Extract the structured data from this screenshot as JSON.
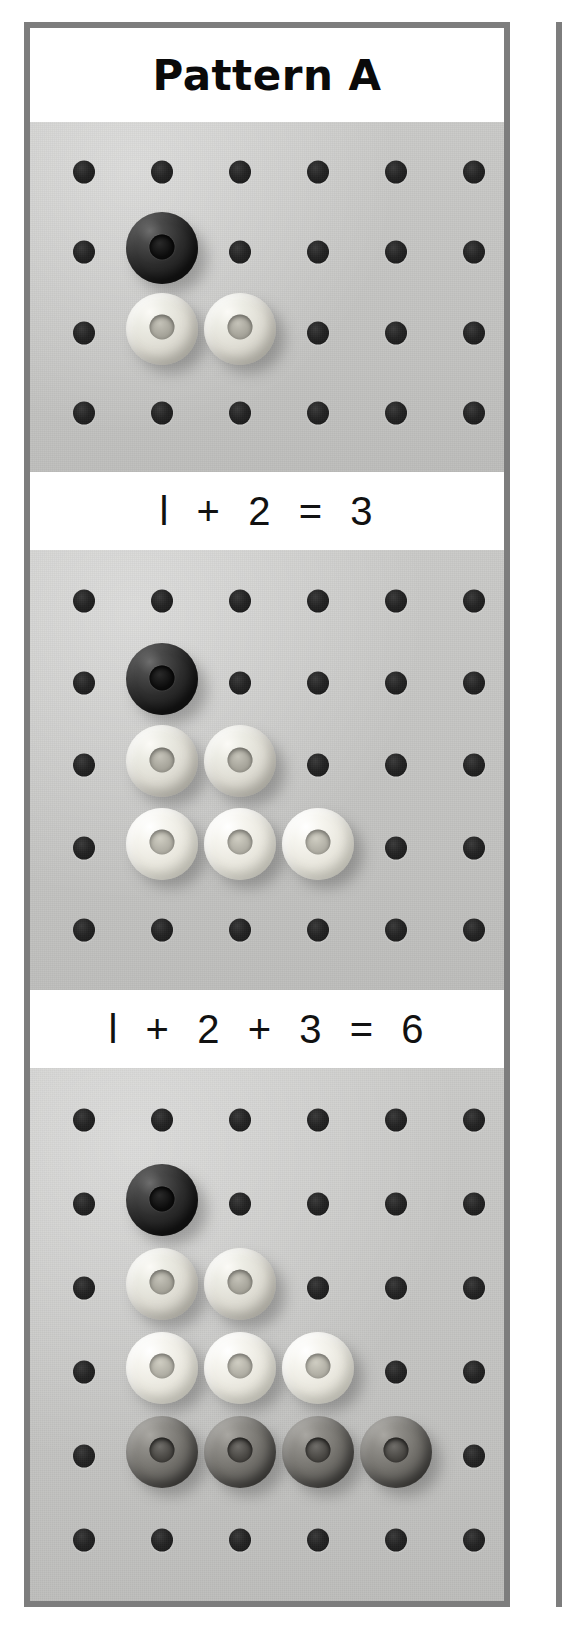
{
  "page": {
    "title": "Pattern A",
    "width": 570,
    "height": 1643,
    "background": "#ffffff"
  },
  "colors": {
    "frame_border": "#7d7d7d",
    "board": "#c6c6c4",
    "hole": "#1a1a1a",
    "bead_dark": "#2b2b2b",
    "bead_light": "#e2e0d7",
    "bead_pale": "#efede4",
    "bead_medium": "#74726d",
    "caption_background": "#ffffff",
    "caption_text": "#111111"
  },
  "header": {
    "label": "Pattern A"
  },
  "panels": [
    {
      "id": "panel-1",
      "name": "pegboard-step-1",
      "rows": 4,
      "cols": 6,
      "caption": "1 + 2 = 3",
      "caption_display": "l  +  2  =  3",
      "beads": [
        {
          "row": 1,
          "col": 1,
          "color": "dark",
          "count_in_row": 1
        },
        {
          "row": 2,
          "col": 1,
          "color": "light",
          "count_in_row": 2
        },
        {
          "row": 2,
          "col": 2,
          "color": "light",
          "count_in_row": 2
        }
      ],
      "bead_rows": [
        1,
        2
      ],
      "total_beads": 3
    },
    {
      "id": "panel-2",
      "name": "pegboard-step-2",
      "rows": 5,
      "cols": 6,
      "caption": "1 + 2 + 3 = 6",
      "caption_display": "l  +  2  +  3  =  6",
      "beads": [
        {
          "row": 1,
          "col": 1,
          "color": "dark",
          "count_in_row": 1
        },
        {
          "row": 2,
          "col": 1,
          "color": "light",
          "count_in_row": 2
        },
        {
          "row": 2,
          "col": 2,
          "color": "light",
          "count_in_row": 2
        },
        {
          "row": 3,
          "col": 1,
          "color": "pale",
          "count_in_row": 3
        },
        {
          "row": 3,
          "col": 2,
          "color": "pale",
          "count_in_row": 3
        },
        {
          "row": 3,
          "col": 3,
          "color": "pale",
          "count_in_row": 3
        }
      ],
      "bead_rows": [
        1,
        2,
        3
      ],
      "total_beads": 6
    },
    {
      "id": "panel-3",
      "name": "pegboard-step-3",
      "rows": 6,
      "cols": 6,
      "caption": "",
      "caption_display": "",
      "beads": [
        {
          "row": 1,
          "col": 1,
          "color": "dark",
          "count_in_row": 1
        },
        {
          "row": 2,
          "col": 1,
          "color": "light",
          "count_in_row": 2
        },
        {
          "row": 2,
          "col": 2,
          "color": "light",
          "count_in_row": 2
        },
        {
          "row": 3,
          "col": 1,
          "color": "pale",
          "count_in_row": 3
        },
        {
          "row": 3,
          "col": 2,
          "color": "pale",
          "count_in_row": 3
        },
        {
          "row": 3,
          "col": 3,
          "color": "pale",
          "count_in_row": 3
        },
        {
          "row": 4,
          "col": 1,
          "color": "medium",
          "count_in_row": 4
        },
        {
          "row": 4,
          "col": 2,
          "color": "medium",
          "count_in_row": 4
        },
        {
          "row": 4,
          "col": 3,
          "color": "medium",
          "count_in_row": 4
        },
        {
          "row": 4,
          "col": 4,
          "color": "medium",
          "count_in_row": 4
        }
      ],
      "bead_rows": [
        1,
        2,
        3,
        4
      ],
      "total_beads": 10
    }
  ],
  "captions": {
    "eq1": "l  +  2  =  3",
    "eq2": "l  +  2  +  3  =  6"
  },
  "chart_data": {
    "type": "bar",
    "title": "Pattern A",
    "categories": [
      "Row 1",
      "Row 2",
      "Row 3",
      "Row 4"
    ],
    "values": [
      1,
      2,
      3,
      4
    ],
    "series": [
      {
        "name": "Step 1 (1 + 2 = 3)",
        "values": [
          1,
          2,
          0,
          0
        ]
      },
      {
        "name": "Step 2 (1 + 2 + 3 = 6)",
        "values": [
          1,
          2,
          3,
          0
        ]
      },
      {
        "name": "Step 3",
        "values": [
          1,
          2,
          3,
          4
        ]
      }
    ],
    "running_totals": [
      3,
      6,
      10
    ],
    "xlabel": "Row",
    "ylabel": "Beads",
    "ylim": [
      0,
      4
    ],
    "annotations": [
      "l  +  2  =  3",
      "l  +  2  +  3  =  6"
    ]
  }
}
